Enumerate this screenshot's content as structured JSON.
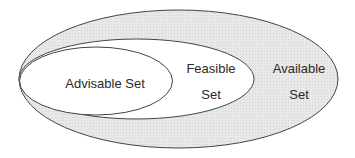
{
  "diagram": {
    "type": "nested-sets",
    "sets": [
      {
        "id": "available",
        "label_line1": "Available",
        "label_line2": "Set",
        "fill": "#e6e6e6"
      },
      {
        "id": "feasible",
        "label_line1": "Feasible",
        "label_line2": "Set",
        "fill": "#ffffff"
      },
      {
        "id": "advisable",
        "label": "Advisable Set",
        "fill": "#ffffff"
      }
    ],
    "stroke": "#444444"
  }
}
